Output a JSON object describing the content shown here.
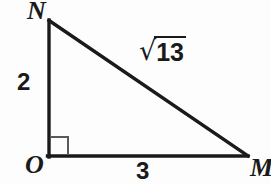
{
  "figure": {
    "kind": "right-triangle-diagram",
    "background_color": "#fdfdfd",
    "stroke_color": "#1a1a1a",
    "right_angle_marker_color": "#4d4d4d",
    "vertices": [
      {
        "name": "N",
        "label": "N",
        "x": 49,
        "y": 20
      },
      {
        "name": "O",
        "label": "O",
        "x": 49,
        "y": 156
      },
      {
        "name": "M",
        "label": "M",
        "x": 247,
        "y": 156
      }
    ],
    "sides": [
      {
        "name": "leg-vertical",
        "from": "N",
        "to": "O",
        "label": "2"
      },
      {
        "name": "leg-horizontal",
        "from": "O",
        "to": "M",
        "label": "3"
      },
      {
        "name": "hypotenuse",
        "from": "N",
        "to": "M",
        "radical_sign": "√",
        "radicand": "13",
        "label": "√13"
      }
    ],
    "right_angle": {
      "at_vertex": "O",
      "marker_size": 18,
      "marker": "square"
    }
  }
}
